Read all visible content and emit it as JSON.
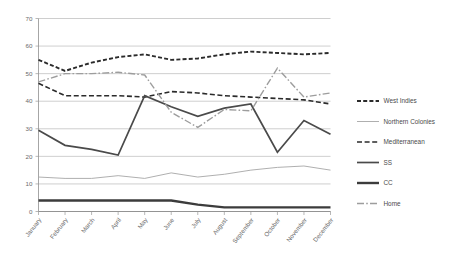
{
  "chart_data": {
    "type": "line",
    "title": "",
    "subtitle": "",
    "xlabel": "",
    "ylabel": "",
    "ylim": [
      0,
      70
    ],
    "ytick_values": [
      0,
      10,
      20,
      30,
      40,
      50,
      60,
      70
    ],
    "ytick_labels": [
      "0",
      "10",
      "20",
      "30",
      "40",
      "50",
      "60",
      "70"
    ],
    "grid": true,
    "legend_position": "right",
    "categories": [
      "January",
      "February",
      "March",
      "April",
      "May",
      "June",
      "July",
      "August",
      "September",
      "October",
      "November",
      "December"
    ],
    "series": [
      {
        "name": "West Indies",
        "style": "dashed",
        "color": "#2b2b2b",
        "width": 1.9,
        "dash": "4,2.2",
        "values": [
          55,
          51,
          54,
          56,
          57,
          55,
          55.5,
          57,
          58,
          57.5,
          57,
          57.5
        ]
      },
      {
        "name": "Northern Colonies",
        "style": "solid-thin",
        "color": "#a6a6a6",
        "width": 0.9,
        "dash": "none",
        "values": [
          12.5,
          12,
          12,
          13,
          12,
          14,
          12.5,
          13.5,
          15,
          16,
          16.5,
          15
        ]
      },
      {
        "name": "Mediterranean",
        "style": "dashed",
        "color": "#2b2b2b",
        "width": 1.6,
        "dash": "5,2.6",
        "values": [
          46.5,
          42,
          42,
          42,
          41.5,
          43.5,
          43,
          42,
          41.5,
          41,
          40.5,
          39
        ]
      },
      {
        "name": "SS",
        "style": "solid-thick",
        "color": "#4a4a4a",
        "width": 1.7,
        "dash": "none",
        "values": [
          29.5,
          24,
          22.5,
          20.5,
          42,
          38,
          34.5,
          37.5,
          39,
          21.5,
          33,
          28
        ]
      },
      {
        "name": "CC",
        "style": "solid-thick",
        "color": "#3c3c3c",
        "width": 2.4,
        "dash": "none",
        "values": [
          4,
          4,
          4,
          4,
          4,
          4,
          2.5,
          1.5,
          1.5,
          1.5,
          1.5,
          1.5
        ]
      },
      {
        "name": "Home",
        "style": "dash-dot",
        "color": "#9d9d9d",
        "width": 1.4,
        "dash": "7,2.2,1.6,2.2",
        "values": [
          47,
          50,
          50,
          50.5,
          49.5,
          36,
          30.5,
          37,
          36.5,
          52,
          41.5,
          43
        ]
      }
    ]
  },
  "legend": {
    "entries": [
      {
        "label": "West Indies"
      },
      {
        "label": "Northern Colonies"
      },
      {
        "label": "Mediterranean"
      },
      {
        "label": "SS"
      },
      {
        "label": "CC"
      },
      {
        "label": "Home"
      }
    ]
  }
}
